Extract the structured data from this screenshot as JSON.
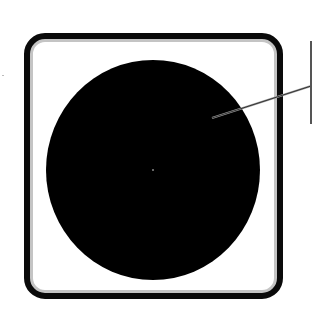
{
  "diagram": {
    "type": "technical-illustration",
    "colors": {
      "background": "#ffffff",
      "frame_stroke": "#0a0a0a",
      "frame_inner_shade": "#b8b8b8",
      "circle_fill": "#000000",
      "leader_line": "#333333",
      "callout_bar": "#555555"
    },
    "frame": {
      "x": 27,
      "y": 36,
      "width": 253,
      "height": 260,
      "corner_radius": 18,
      "stroke_width": 6
    },
    "circle": {
      "cx": 153,
      "cy": 170,
      "rx": 107,
      "ry": 110
    },
    "leader": {
      "x1": 212,
      "y1": 118,
      "x2": 311,
      "y2": 86
    },
    "callout_bar": {
      "x": 310,
      "y": 41,
      "height": 83
    },
    "labels": []
  }
}
